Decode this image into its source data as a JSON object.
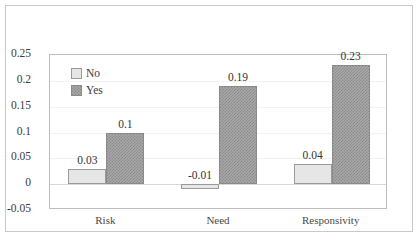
{
  "chart_data": {
    "type": "bar",
    "title": "",
    "xlabel": "",
    "ylabel": "",
    "categories": [
      "Risk",
      "Need",
      "Responsivity"
    ],
    "series": [
      {
        "name": "No",
        "values": [
          0.03,
          -0.01,
          0.04
        ],
        "labels": [
          "0.03",
          "-0.01",
          "0.04"
        ],
        "color": "#e6e6e6"
      },
      {
        "name": "Yes",
        "values": [
          0.1,
          0.19,
          0.23
        ],
        "labels": [
          "0.1",
          "0.19",
          "0.23"
        ],
        "color": "#a8a8a8"
      }
    ],
    "ylim": [
      -0.05,
      0.25
    ],
    "ytick_values": [
      0.25,
      0.2,
      0.15,
      0.1,
      0.05,
      0,
      -0.05
    ],
    "ytick_labels": [
      "0.25",
      "0.2",
      "0.15",
      "0.1",
      "0.05",
      "0",
      "-0.05"
    ],
    "grid": true,
    "legend_position": "top-left-inside",
    "zero_line": 0
  }
}
